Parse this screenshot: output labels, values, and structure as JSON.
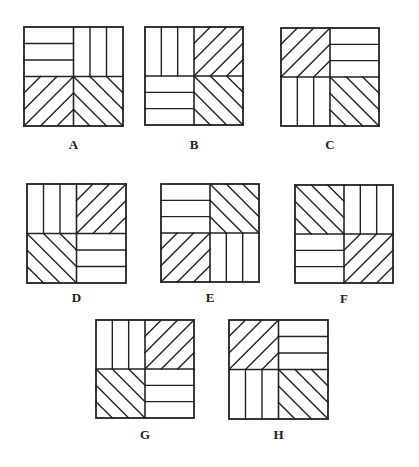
{
  "diagram": {
    "title": "",
    "stroke_color": "#222222",
    "background": "#ffffff",
    "pattern_legend": {
      "H": "horizontal stripes (3 bands)",
      "V": "vertical stripes (3 bands)",
      "D1": "diagonal lines rising left-to-right (/)",
      "D2": "diagonal lines falling left-to-right (\\)"
    },
    "figures": [
      {
        "label": "A",
        "x": 24,
        "y": 27,
        "size": 99,
        "label_y": 138,
        "quadrants": {
          "tl": "H",
          "tr": "V",
          "bl": "D1",
          "br": "D2"
        }
      },
      {
        "label": "B",
        "x": 145,
        "y": 27,
        "size": 98,
        "label_y": 138,
        "quadrants": {
          "tl": "V",
          "tr": "D1",
          "bl": "H",
          "br": "D2"
        }
      },
      {
        "label": "C",
        "x": 281,
        "y": 28,
        "size": 98,
        "label_y": 138,
        "quadrants": {
          "tl": "D1",
          "tr": "H",
          "bl": "V",
          "br": "D2"
        }
      },
      {
        "label": "D",
        "x": 27,
        "y": 184,
        "size": 99,
        "label_y": 291,
        "quadrants": {
          "tl": "V",
          "tr": "D1",
          "bl": "D2",
          "br": "H"
        }
      },
      {
        "label": "E",
        "x": 161,
        "y": 184,
        "size": 98,
        "label_y": 291,
        "quadrants": {
          "tl": "H",
          "tr": "D2",
          "bl": "D1",
          "br": "V"
        }
      },
      {
        "label": "F",
        "x": 295,
        "y": 185,
        "size": 98,
        "label_y": 292,
        "quadrants": {
          "tl": "D2",
          "tr": "V",
          "bl": "H",
          "br": "D1"
        }
      },
      {
        "label": "G",
        "x": 96,
        "y": 320,
        "size": 98,
        "label_y": 428,
        "quadrants": {
          "tl": "V",
          "tr": "D1",
          "bl": "D2",
          "br": "H"
        }
      },
      {
        "label": "H",
        "x": 229,
        "y": 320,
        "size": 99,
        "label_y": 428,
        "quadrants": {
          "tl": "D1",
          "tr": "H",
          "bl": "V",
          "br": "D2"
        }
      }
    ]
  }
}
